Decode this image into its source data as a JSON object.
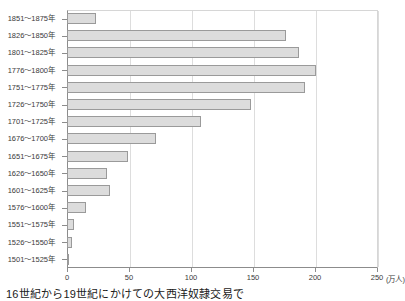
{
  "caption": "16世紀から19世紀にかけての大西洋奴隷交易で",
  "axis_unit_label": "(万人)",
  "colors": {
    "bar_fill": "#dcdcdc",
    "bar_border": "#9a9a9a",
    "gridline": "#dddddd",
    "axis": "#8c8c8c",
    "text": "#3a3a3a"
  },
  "chart_data": {
    "type": "bar",
    "orientation": "horizontal",
    "title": "",
    "subtitle": "",
    "xlabel": "(万人)",
    "ylabel": "",
    "xlim": [
      0,
      250
    ],
    "ylim": null,
    "grid": true,
    "legend": false,
    "legend_position": "none",
    "xticks": [
      0,
      50,
      100,
      150,
      200,
      250
    ],
    "xtick_labels": [
      "0",
      "50",
      "100",
      "150",
      "200",
      "250"
    ],
    "categories": [
      "1851〜1875年",
      "1826〜1850年",
      "1801〜1825年",
      "1776〜1800年",
      "1751〜1775年",
      "1726〜1750年",
      "1701〜1725年",
      "1676〜1700年",
      "1651〜1675年",
      "1626〜1650年",
      "1601〜1625年",
      "1576〜1600年",
      "1551〜1575年",
      "1526〜1550年",
      "1501〜1525年"
    ],
    "values": [
      23,
      177,
      187,
      201,
      192,
      148,
      108,
      72,
      49,
      32,
      35,
      15,
      6,
      4,
      1
    ],
    "series": [
      {
        "name": "大西洋奴隷交易 連行者数",
        "values": [
          23,
          177,
          187,
          201,
          192,
          148,
          108,
          72,
          49,
          32,
          35,
          15,
          6,
          4,
          1
        ]
      }
    ]
  }
}
